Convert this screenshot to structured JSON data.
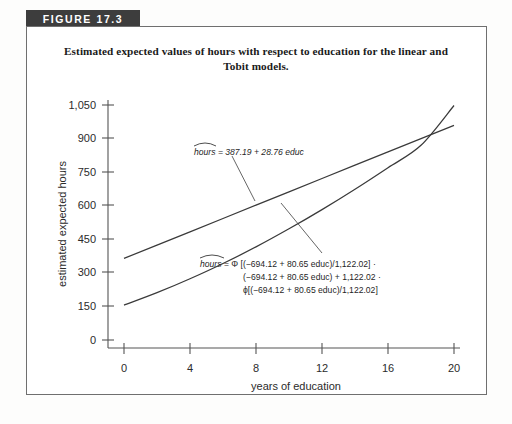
{
  "figure": {
    "banner_label": "FIGURE 17.3",
    "title": "Estimated expected values of hours with respect to education for the linear and Tobit models.",
    "title_line1": "Estimated expected values of hours with respect to education for the linear and",
    "title_line2": "Tobit models."
  },
  "colors": {
    "banner_bg": "#3d3d3d",
    "banner_text": "#ffffff",
    "box_border": "#6f6f6f",
    "curve": "#3a3a3a",
    "axis": "#555555",
    "text": "#1f1f1f",
    "page_bg": "#fdfdfc"
  },
  "annotations": {
    "linear": {
      "hat_word": "hours",
      "text": " = 387.19 + 28.76 educ",
      "full": "hours = 387.19 + 28.76 educ"
    },
    "tobit": {
      "hat_word": "hours",
      "line1": " = Φ [(−694.12 + 80.65 educ)/1,122.02] ·",
      "line2": "(−694.12 + 80.65 educ) + 1,122.02 ·",
      "line3": "ϕ[(−694.12 + 80.65 educ)/1,122.02]",
      "full": "hours = Φ [(−694.12 + 80.65 educ)/1,122.02] · (−694.12 + 80.65 educ) + 1,122.02 · ϕ[(−694.12 + 80.65 educ)/1,122.02]"
    }
  },
  "chart_data": {
    "type": "line",
    "title": "Estimated expected values of hours with respect to education for the linear and Tobit models.",
    "xlabel": "years of education",
    "ylabel": "estimated expected  hours",
    "xlim": [
      0,
      21.4
    ],
    "ylim": [
      0,
      1110
    ],
    "xticks": [
      0,
      4,
      8,
      12,
      16,
      20
    ],
    "xticklabels": [
      "0",
      "4",
      "8",
      "12",
      "16",
      "20"
    ],
    "yticks": [
      0,
      150,
      300,
      450,
      600,
      750,
      900,
      1050
    ],
    "yticklabels": [
      "0",
      "150",
      "300",
      "450",
      "600",
      "750",
      "900",
      "1,050"
    ],
    "grid": false,
    "legend": "none",
    "series": [
      {
        "name": "linear model",
        "equation": "hours = 387.19 + 28.76 educ",
        "intercept": 387.19,
        "slope": 28.76,
        "x": [
          0,
          2,
          4,
          6,
          8,
          10,
          12,
          14,
          16,
          18,
          20
        ],
        "values": [
          387.19,
          444.71,
          502.23,
          559.75,
          617.27,
          674.79,
          732.31,
          789.83,
          847.35,
          904.87,
          962.39
        ]
      },
      {
        "name": "Tobit model",
        "equation": "hours = Φ[(−694.12 + 80.65 educ)/1,122.02] · (−694.12 + 80.65 educ) + 1,122.02 · ϕ[(−694.12 + 80.65 educ)/1,122.02]",
        "xb_intercept": -694.12,
        "xb_slope": 80.65,
        "sigma": 1122.02,
        "x": [
          0,
          2,
          4,
          6,
          8,
          10,
          12,
          14,
          16,
          18,
          20
        ],
        "values": [
          185,
          239,
          299,
          365,
          437,
          515,
          598,
          686,
          779,
          876,
          1048
        ]
      }
    ],
    "crossing_point": {
      "x": 17.2,
      "y": 882
    }
  }
}
